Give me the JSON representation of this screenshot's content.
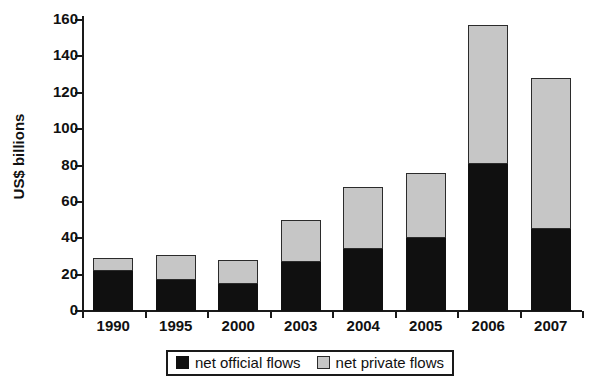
{
  "chart_data": {
    "type": "bar",
    "stacked": true,
    "title": "",
    "xlabel": "",
    "ylabel": "US$ billions",
    "categories": [
      "1990",
      "1995",
      "2000",
      "2003",
      "2004",
      "2005",
      "2006",
      "2007"
    ],
    "series": [
      {
        "name": "net official flows",
        "color": "#101010",
        "values": [
          22,
          17,
          15,
          27,
          34,
          40,
          81,
          45
        ]
      },
      {
        "name": "net private flows",
        "color": "#c6c6c6",
        "values": [
          7,
          14,
          13,
          23,
          34,
          36,
          76,
          83
        ]
      }
    ],
    "totals": [
      29,
      31,
      28,
      50,
      68,
      76,
      157,
      128
    ],
    "ylim": [
      0,
      160
    ],
    "yticks": [
      0,
      20,
      40,
      60,
      80,
      100,
      120,
      140,
      160
    ],
    "ytick_labels": [
      "0",
      "20",
      "40",
      "60",
      "80",
      "100",
      "120",
      "140",
      "160"
    ],
    "grid": false,
    "legend_position": "bottom"
  },
  "legend": {
    "entries": [
      {
        "label": "net official flows",
        "swatch": "black-square-icon"
      },
      {
        "label": "net private flows",
        "swatch": "gray-square-icon"
      }
    ]
  }
}
